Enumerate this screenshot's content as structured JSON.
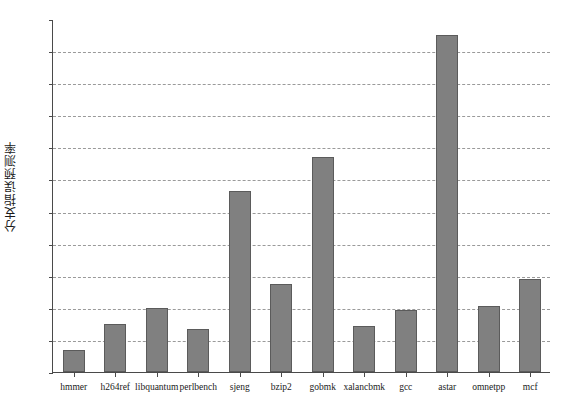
{
  "chart_data": {
    "type": "bar",
    "title": "",
    "xlabel": "",
    "ylabel": "分支指误预测率",
    "categories": [
      "hmmer",
      "h264ref",
      "libquantum",
      "perlbench",
      "sjeng",
      "bzip2",
      "gobmk",
      "xalancbmk",
      "gcc",
      "astar",
      "omnetpp",
      "mcf"
    ],
    "values": [
      1.4,
      3.0,
      4.0,
      2.7,
      11.3,
      5.5,
      13.4,
      2.85,
      3.85,
      21.0,
      4.1,
      5.8
    ],
    "ylim": [
      0,
      22
    ],
    "ytick_values": [
      0,
      2,
      4,
      6,
      8,
      10,
      12,
      14,
      16,
      18,
      20,
      22
    ],
    "ytick_labels": [
      "0%",
      "2%",
      "4%",
      "6%",
      "8%",
      "10%",
      "12%",
      "14%",
      "16%",
      "18%",
      "20%",
      "22%"
    ],
    "grid": true,
    "grid_style": "dashed",
    "legend": false,
    "bar_color": "#808080",
    "bar_edge_color": "#5b5b5b",
    "axis_color": "#4a4a4a",
    "grid_color": "#9a9a9a",
    "background": "#ffffff"
  }
}
